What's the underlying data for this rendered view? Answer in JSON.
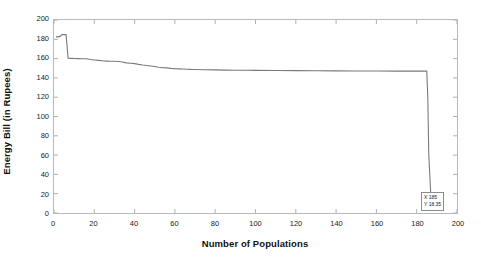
{
  "chart_data": {
    "type": "line",
    "title": "",
    "xlabel": "Number of Populations",
    "ylabel": "Energy Bill (in Rupees)",
    "xlim": [
      0,
      200
    ],
    "ylim": [
      0,
      200
    ],
    "xticks": [
      0,
      20,
      40,
      60,
      80,
      100,
      120,
      140,
      160,
      180,
      200
    ],
    "yticks": [
      0,
      20,
      40,
      60,
      80,
      100,
      120,
      140,
      160,
      180,
      200
    ],
    "grid": false,
    "legend": null,
    "line_color": "#7a7a7a",
    "series": [
      {
        "name": "Energy Bill",
        "x": [
          1,
          2,
          3,
          4,
          5,
          6,
          7,
          8,
          9,
          10,
          12,
          14,
          16,
          18,
          20,
          22,
          24,
          25,
          26,
          28,
          30,
          32,
          34,
          36,
          38,
          40,
          42,
          44,
          46,
          48,
          50,
          52,
          54,
          56,
          58,
          60,
          62,
          64,
          66,
          68,
          70,
          75,
          80,
          85,
          90,
          95,
          100,
          110,
          120,
          130,
          140,
          150,
          160,
          170,
          180,
          184,
          185,
          185.5,
          186,
          187
        ],
        "y": [
          182.5,
          182.5,
          183.0,
          184.8,
          184.8,
          184.8,
          160.3,
          160.2,
          160.2,
          160.1,
          160.0,
          159.9,
          159.8,
          159.0,
          158.6,
          158.2,
          157.8,
          157.5,
          157.4,
          157.3,
          157.2,
          157.0,
          156.5,
          155.6,
          155.2,
          154.8,
          154.0,
          153.4,
          152.9,
          152.4,
          151.8,
          151.0,
          150.6,
          150.4,
          149.9,
          149.6,
          149.4,
          149.2,
          149.0,
          148.8,
          148.7,
          148.5,
          148.3,
          148.1,
          148.0,
          147.9,
          147.8,
          147.6,
          147.5,
          147.4,
          147.3,
          147.2,
          147.1,
          147.0,
          147.0,
          147.0,
          147.0,
          120.0,
          60.0,
          18.35
        ]
      }
    ],
    "annotations": [
      {
        "type": "datatip",
        "x_label": "X 185",
        "y_label": "Y 18.35",
        "x_value": 185,
        "y_value": 18.35
      }
    ]
  },
  "axis": {
    "x_tick_labels": [
      "0",
      "20",
      "40",
      "60",
      "80",
      "100",
      "120",
      "140",
      "160",
      "180",
      "200"
    ],
    "y_tick_labels": [
      "0",
      "20",
      "40",
      "60",
      "80",
      "100",
      "120",
      "140",
      "160",
      "180",
      "200"
    ],
    "x_title": "Number of Populations",
    "y_title": "Energy Bill (in Rupees)"
  },
  "datatip": {
    "line1": "X 185",
    "line2": "Y 18.35"
  }
}
